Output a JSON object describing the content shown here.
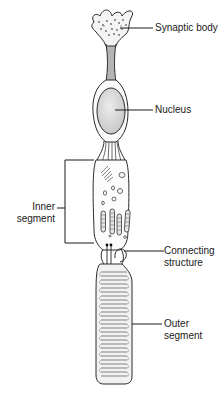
{
  "figure": {
    "background": "#ffffff",
    "stroke_color": "#2a2a2a",
    "nucleus_fill": "#d9d9d9"
  },
  "labels": {
    "synaptic_body": "Synaptic body",
    "nucleus": "Nucleus",
    "inner_segment_line1": "Inner",
    "inner_segment_line2": "segment",
    "connecting_structure_line1": "Connecting",
    "connecting_structure_line2": "structure",
    "outer_segment_line1": "Outer",
    "outer_segment_line2": "segment"
  }
}
